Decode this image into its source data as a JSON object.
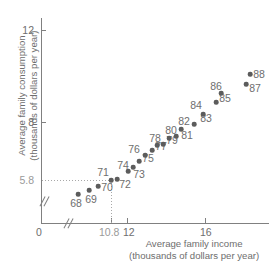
{
  "chart_data": {
    "type": "scatter",
    "title": "",
    "xlabel": "Average family income (thousands of dollars per year)",
    "ylabel": "Average family consumption (thousands of dollars per year)",
    "xlabel_line1": "Average family income",
    "xlabel_line2": "(thousands of dollars per year)",
    "ylabel_line1": "Average family consumption",
    "ylabel_line2": "(thousands of dollars per year)",
    "xlim": [
      10.0,
      17.8
    ],
    "ylim": [
      4.9,
      12.6
    ],
    "grid": false,
    "legend": null,
    "axis_broken_x": true,
    "axis_broken_y": true,
    "origin_label": "0",
    "xticks": [
      "10.8",
      "12",
      "16"
    ],
    "xtick_values": [
      10.8,
      12,
      16
    ],
    "yticks": [
      "5.8",
      "8",
      "12"
    ],
    "ytick_values": [
      5.8,
      8,
      12
    ],
    "reference_lines": {
      "x": 10.8,
      "y": 5.8,
      "x_label": "10.8",
      "y_label": "5.8",
      "points_to": "71"
    },
    "point_label_field": "year",
    "points": [
      {
        "year": "68",
        "x": 11.68,
        "y": 5.1,
        "lx": 76,
        "ly": 203,
        "px": 78,
        "py": 194
      },
      {
        "year": "69",
        "x": 12.25,
        "y": 5.31,
        "lx": 91,
        "ly": 199,
        "px": 89,
        "py": 190
      },
      {
        "year": "70",
        "x": 12.71,
        "y": 5.52,
        "lx": 107,
        "ly": 187,
        "px": 98,
        "py": 186
      },
      {
        "year": "71",
        "x": 10.8,
        "y": 5.8,
        "lx": 103,
        "ly": 172,
        "px": 111,
        "py": 180
      },
      {
        "year": "72",
        "x": 13.45,
        "y": 5.8,
        "lx": 125,
        "ly": 184,
        "px": 117,
        "py": 179
      },
      {
        "year": "73",
        "x": 13.76,
        "y": 6.12,
        "lx": 139,
        "ly": 174,
        "px": 128,
        "py": 171
      },
      {
        "year": "74",
        "x": 13.66,
        "y": 6.28,
        "lx": 123,
        "ly": 165,
        "px": 133,
        "py": 167
      },
      {
        "year": "75",
        "x": 14.02,
        "y": 6.49,
        "lx": 148,
        "ly": 158,
        "px": 139,
        "py": 161
      },
      {
        "year": "76",
        "x": 14.23,
        "y": 6.7,
        "lx": 134,
        "ly": 149,
        "px": 145,
        "py": 155
      },
      {
        "year": "77",
        "x": 14.54,
        "y": 6.86,
        "lx": 161,
        "ly": 146,
        "px": 152,
        "py": 150
      },
      {
        "year": "78",
        "x": 14.59,
        "y": 7.02,
        "lx": 155,
        "ly": 138,
        "px": 157,
        "py": 145
      },
      {
        "year": "79",
        "x": 14.95,
        "y": 7.07,
        "lx": 172,
        "ly": 140,
        "px": 163,
        "py": 144
      },
      {
        "year": "80",
        "x": 15.11,
        "y": 7.33,
        "lx": 171,
        "ly": 130,
        "px": 169,
        "py": 138
      },
      {
        "year": "81",
        "x": 15.41,
        "y": 7.38,
        "lx": 187,
        "ly": 135,
        "px": 176,
        "py": 136
      },
      {
        "year": "82",
        "x": 15.52,
        "y": 7.64,
        "lx": 184,
        "ly": 121,
        "px": 181,
        "py": 129
      },
      {
        "year": "83",
        "x": 16.03,
        "y": 7.8,
        "lx": 206,
        "ly": 118,
        "px": 194,
        "py": 124
      },
      {
        "year": "84",
        "x": 16.34,
        "y": 8.16,
        "lx": 196,
        "ly": 105,
        "px": 203,
        "py": 114
      },
      {
        "year": "85",
        "x": 16.85,
        "y": 8.53,
        "lx": 225,
        "ly": 98,
        "px": 216,
        "py": 102
      },
      {
        "year": "86",
        "x": 16.95,
        "y": 8.85,
        "lx": 216,
        "ly": 86,
        "px": 221,
        "py": 93
      },
      {
        "year": "87",
        "x": 17.46,
        "y": 9.01,
        "lx": 255,
        "ly": 88,
        "px": 246,
        "py": 84
      },
      {
        "year": "88",
        "x": 17.61,
        "y": 9.38,
        "lx": 259,
        "ly": 74,
        "px": 250,
        "py": 74
      }
    ]
  },
  "colors": {
    "point": "#5c5c5c",
    "axis": "#808080",
    "text": "#6e6e6e",
    "reference": "#9a9a9a",
    "background": "#ffffff"
  }
}
